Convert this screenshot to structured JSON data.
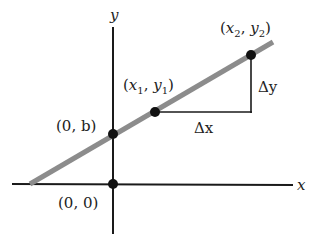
{
  "diagram": {
    "type": "slope-intercept line on coordinate axes",
    "axes": {
      "x_label": "x",
      "y_label": "y"
    },
    "points": [
      {
        "id": "origin",
        "label": "(0, 0)"
      },
      {
        "id": "y_intercept",
        "label": "(0, b)"
      },
      {
        "id": "p1",
        "label_parts": [
          "(",
          "x",
          "1",
          ", ",
          "y",
          "1",
          ")"
        ]
      },
      {
        "id": "p2",
        "label_parts": [
          "(",
          "x",
          "2",
          ", ",
          "y",
          "2",
          ")"
        ]
      }
    ],
    "deltas": {
      "dx_label": "Δx",
      "dy_label": "Δy"
    },
    "colors": {
      "axis": "#1a1a1a",
      "line": "#8c8c8c",
      "point": "#111111",
      "triangle": "#1a1a1a"
    }
  }
}
